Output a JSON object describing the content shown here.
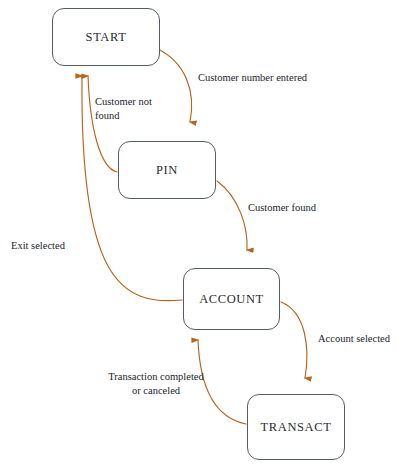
{
  "diagram": {
    "type": "state-transition-diagram",
    "canvas": {
      "width": 397,
      "height": 469
    },
    "colors": {
      "background": "#ffffff",
      "node_border": "#555b66",
      "node_fill": "#ffffff",
      "node_text": "#2b2b33",
      "edge": "#b5651d",
      "edge_label_text": "#23232b"
    },
    "nodes": [
      {
        "id": "start",
        "label": "START",
        "x": 52,
        "y": 8,
        "width": 108,
        "height": 58
      },
      {
        "id": "pin",
        "label": "PIN",
        "x": 118,
        "y": 141,
        "width": 98,
        "height": 58
      },
      {
        "id": "account",
        "label": "ACCOUNT",
        "x": 183,
        "y": 268,
        "width": 97,
        "height": 62
      },
      {
        "id": "transact",
        "label": "TRANSACT",
        "x": 247,
        "y": 394,
        "width": 98,
        "height": 66
      }
    ],
    "edges": [
      {
        "id": "start-to-pin",
        "from": "START",
        "to": "PIN",
        "label": "Customer number entered",
        "label_x": 198,
        "label_y": 71,
        "align": "left"
      },
      {
        "id": "pin-to-start",
        "from": "PIN",
        "to": "START",
        "label": "Customer not\nfound",
        "label_x": 95,
        "label_y": 95,
        "align": "left"
      },
      {
        "id": "pin-to-account",
        "from": "PIN",
        "to": "ACCOUNT",
        "label": "Customer found",
        "label_x": 248,
        "label_y": 201,
        "align": "left"
      },
      {
        "id": "account-to-start",
        "from": "ACCOUNT",
        "to": "START",
        "label": "Exit selected",
        "label_x": 11,
        "label_y": 239,
        "align": "left"
      },
      {
        "id": "account-to-transact",
        "from": "ACCOUNT",
        "to": "TRANSACT",
        "label": "Account selected",
        "label_x": 318,
        "label_y": 332,
        "align": "left"
      },
      {
        "id": "transact-to-account",
        "from": "TRANSACT",
        "to": "ACCOUNT",
        "label": "Transaction completed\nor canceled",
        "label_x": 101,
        "label_y": 370,
        "align": "center"
      }
    ]
  }
}
